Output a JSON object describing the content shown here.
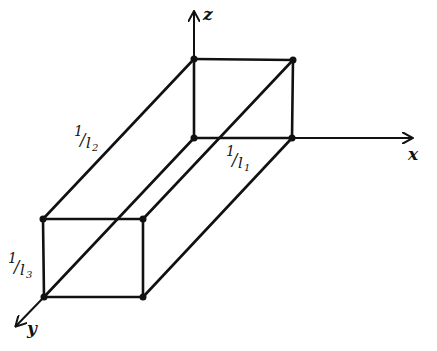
{
  "diagram": {
    "type": "3d-box-reciprocal-intercepts",
    "axes": {
      "x": {
        "label": "x"
      },
      "y": {
        "label": "y"
      },
      "z": {
        "label": "z"
      }
    },
    "edge_labels": {
      "x_length": {
        "num": "1",
        "den": "l",
        "sub": "1"
      },
      "y_length": {
        "num": "1",
        "den": "l",
        "sub": "2"
      },
      "z_length": {
        "num": "1",
        "den": "l",
        "sub": "3"
      }
    },
    "colors": {
      "ink": "#111111",
      "background": "#ffffff"
    }
  }
}
